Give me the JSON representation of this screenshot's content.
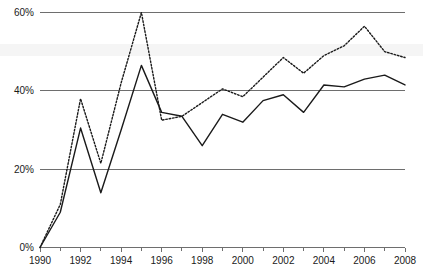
{
  "chart_data": {
    "type": "line",
    "title": "",
    "subtitle": "",
    "xlabel": "",
    "ylabel": "",
    "x": [
      1990,
      1991,
      1992,
      1993,
      1994,
      1995,
      1996,
      1997,
      1998,
      1999,
      2000,
      2001,
      2002,
      2003,
      2004,
      2005,
      2006,
      2007,
      2008
    ],
    "xtick_labels": [
      "1990",
      "1992",
      "1994",
      "1996",
      "1998",
      "2000",
      "2002",
      "2004",
      "2006",
      "2008"
    ],
    "xtick_values": [
      1990,
      1992,
      1994,
      1996,
      1998,
      2000,
      2002,
      2004,
      2006,
      2008
    ],
    "xminor_values": [
      1991,
      1993,
      1995,
      1997,
      1999,
      2001,
      2003,
      2005,
      2007
    ],
    "ytick_labels": [
      "0%",
      "20%",
      "40%",
      "60%"
    ],
    "ytick_values": [
      0,
      20,
      40,
      60
    ],
    "xlim": [
      1990,
      2008
    ],
    "ylim": [
      0,
      60
    ],
    "grid": true,
    "gridlines_at": [
      20,
      40,
      60
    ],
    "legend_position": "none",
    "series": [
      {
        "name": "solid-series",
        "style": "solid",
        "color": "#1a1a1a",
        "values": [
          0,
          9,
          30.5,
          14,
          30,
          46.5,
          34.5,
          33.5,
          26,
          34,
          32,
          37.5,
          39,
          34.5,
          41.5,
          41,
          43,
          44,
          41.5
        ]
      },
      {
        "name": "dotted-series",
        "style": "dotted",
        "color": "#1a1a1a",
        "values": [
          0,
          11,
          38,
          21.5,
          42,
          60,
          32.5,
          33.5,
          37,
          40.5,
          38.5,
          43.5,
          48.5,
          44.5,
          49,
          51.5,
          56.5,
          50,
          48.5
        ]
      }
    ]
  },
  "axes": {
    "y_ticks": [
      "0%",
      "20%",
      "40%",
      "60%"
    ],
    "x_ticks": [
      "1990",
      "1992",
      "1994",
      "1996",
      "1998",
      "2000",
      "2002",
      "2004",
      "2006",
      "2008"
    ]
  },
  "colors": {
    "line": "#1a1a1a",
    "grid": "#6e6e6e",
    "background": "#ffffff",
    "band": "#f2f2f2"
  }
}
